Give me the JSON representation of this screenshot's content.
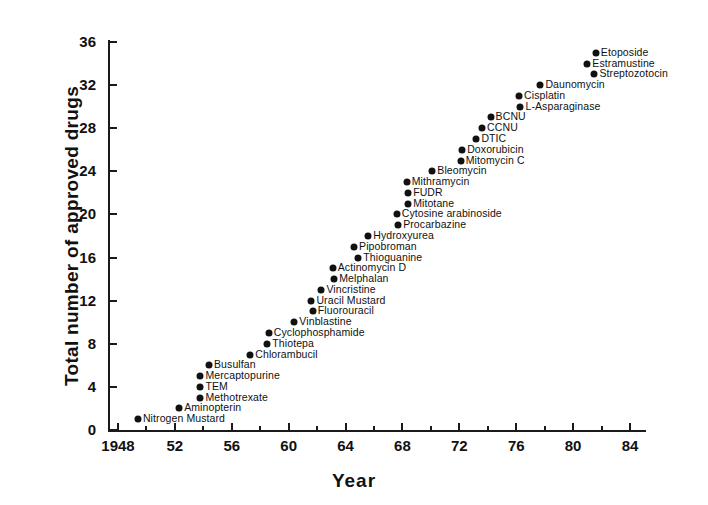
{
  "chart_data": {
    "type": "scatter",
    "title": "",
    "xlabel": "Year",
    "ylabel": "Total number of approved drugs",
    "xlim": [
      1947,
      1985
    ],
    "ylim": [
      0,
      36
    ],
    "grid": false,
    "legend": null,
    "x_ticks": [
      {
        "value": 1948,
        "label": "1948"
      },
      {
        "value": 1950,
        "label": ""
      },
      {
        "value": 1952,
        "label": "52"
      },
      {
        "value": 1954,
        "label": ""
      },
      {
        "value": 1956,
        "label": "56"
      },
      {
        "value": 1958,
        "label": ""
      },
      {
        "value": 1960,
        "label": "60"
      },
      {
        "value": 1962,
        "label": ""
      },
      {
        "value": 1964,
        "label": "64"
      },
      {
        "value": 1966,
        "label": ""
      },
      {
        "value": 1968,
        "label": "68"
      },
      {
        "value": 1970,
        "label": ""
      },
      {
        "value": 1972,
        "label": "72"
      },
      {
        "value": 1974,
        "label": ""
      },
      {
        "value": 1976,
        "label": "76"
      },
      {
        "value": 1978,
        "label": ""
      },
      {
        "value": 1980,
        "label": "80"
      },
      {
        "value": 1982,
        "label": ""
      },
      {
        "value": 1984,
        "label": "84"
      }
    ],
    "y_ticks": [
      {
        "value": 0,
        "label": "0"
      },
      {
        "value": 4,
        "label": "4"
      },
      {
        "value": 8,
        "label": "8"
      },
      {
        "value": 12,
        "label": "12"
      },
      {
        "value": 16,
        "label": "16"
      },
      {
        "value": 20,
        "label": "20"
      },
      {
        "value": 24,
        "label": "24"
      },
      {
        "value": 28,
        "label": "28"
      },
      {
        "value": 32,
        "label": "32"
      },
      {
        "value": 36,
        "label": "36"
      }
    ],
    "points": [
      {
        "label": "Nitrogen Mustard",
        "x": 1949.4,
        "y": 1
      },
      {
        "label": "Aminopterin",
        "x": 1952.3,
        "y": 2
      },
      {
        "label": "Methotrexate",
        "x": 1953.8,
        "y": 3
      },
      {
        "label": "TEM",
        "x": 1953.8,
        "y": 4
      },
      {
        "label": "Mercaptopurine",
        "x": 1953.8,
        "y": 5
      },
      {
        "label": "Busulfan",
        "x": 1954.4,
        "y": 6
      },
      {
        "label": "Chlorambucil",
        "x": 1957.3,
        "y": 7
      },
      {
        "label": "Thiotepa",
        "x": 1958.5,
        "y": 8
      },
      {
        "label": "Cyclophosphamide",
        "x": 1958.6,
        "y": 9
      },
      {
        "label": "Vinblastine",
        "x": 1960.4,
        "y": 10
      },
      {
        "label": "Fluorouracil",
        "x": 1961.7,
        "y": 11
      },
      {
        "label": "Uracil Mustard",
        "x": 1961.6,
        "y": 12
      },
      {
        "label": "Vincristine",
        "x": 1962.3,
        "y": 13
      },
      {
        "label": "Melphalan",
        "x": 1963.2,
        "y": 14
      },
      {
        "label": "Actinomycin D",
        "x": 1963.1,
        "y": 15
      },
      {
        "label": "Thioguanine",
        "x": 1964.9,
        "y": 16
      },
      {
        "label": "Pipobroman",
        "x": 1964.6,
        "y": 17
      },
      {
        "label": "Hydroxyurea",
        "x": 1965.6,
        "y": 18
      },
      {
        "label": "Procarbazine",
        "x": 1967.7,
        "y": 19
      },
      {
        "label": "Cytosine arabinoside",
        "x": 1967.6,
        "y": 20
      },
      {
        "label": "Mitotane",
        "x": 1968.4,
        "y": 21
      },
      {
        "label": "FUDR",
        "x": 1968.4,
        "y": 22
      },
      {
        "label": "Mithramycin",
        "x": 1968.3,
        "y": 23
      },
      {
        "label": "Bleomycin",
        "x": 1970.1,
        "y": 24
      },
      {
        "label": "Mitomycin C",
        "x": 1972.1,
        "y": 25
      },
      {
        "label": "Doxorubicin",
        "x": 1972.2,
        "y": 26
      },
      {
        "label": "DTIC",
        "x": 1973.2,
        "y": 27
      },
      {
        "label": "CCNU",
        "x": 1973.6,
        "y": 28
      },
      {
        "label": "BCNU",
        "x": 1974.2,
        "y": 29
      },
      {
        "label": "L-Asparaginase",
        "x": 1976.3,
        "y": 30
      },
      {
        "label": "Cisplatin",
        "x": 1976.2,
        "y": 31
      },
      {
        "label": "Daunomycin",
        "x": 1977.7,
        "y": 32
      },
      {
        "label": "Streptozotocin",
        "x": 1981.5,
        "y": 33
      },
      {
        "label": "Estramustine",
        "x": 1981.0,
        "y": 34
      },
      {
        "label": "Etoposide",
        "x": 1981.6,
        "y": 35
      }
    ]
  }
}
